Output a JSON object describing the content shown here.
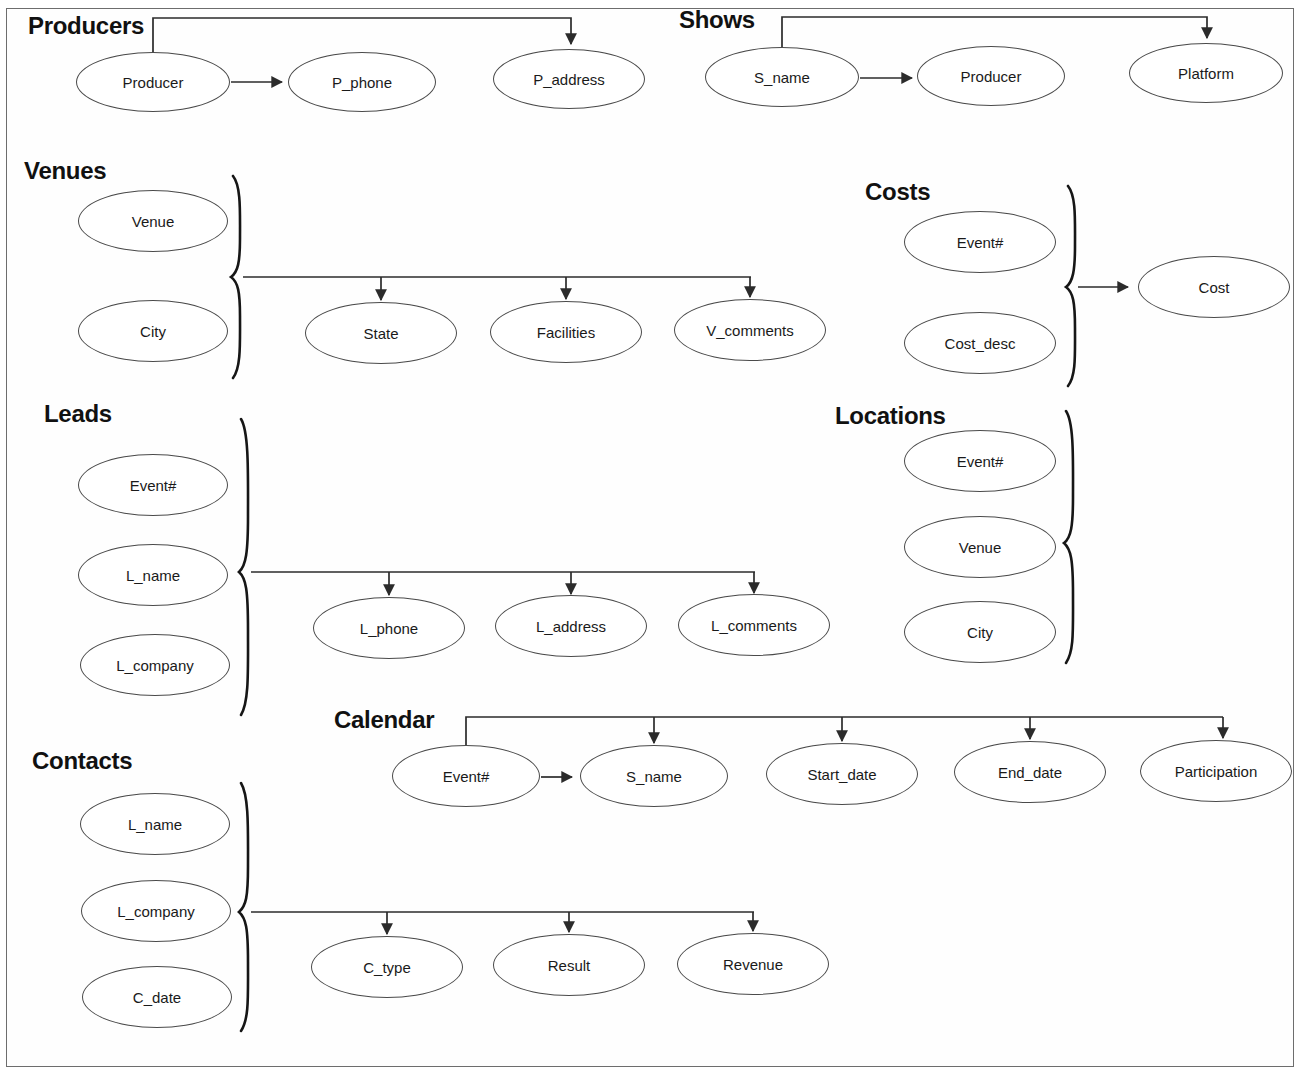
{
  "diagram": {
    "background_color": "#ffffff",
    "border_color": "#6d6d6d",
    "node_stroke_color": "#4a4a4a",
    "edge_color": "#2b2b2b",
    "brace_color": "#161616",
    "groups": [
      {
        "id": "producers",
        "label": "Producers",
        "label_x": 28,
        "label_y": 12,
        "has_brace": false,
        "determinants": [
          "Producer"
        ],
        "dependents": [
          "P_phone",
          "P_address"
        ],
        "nodes": [
          {
            "name": "Producer",
            "cx": 153,
            "cy": 82,
            "rx": 77,
            "ry": 30
          },
          {
            "name": "P_phone",
            "cx": 362,
            "cy": 82,
            "rx": 74,
            "ry": 30
          },
          {
            "name": "P_address",
            "cx": 569,
            "cy": 79,
            "rx": 76,
            "ry": 30
          }
        ]
      },
      {
        "id": "shows",
        "label": "Shows",
        "label_x": 679,
        "label_y": 6,
        "has_brace": false,
        "determinants": [
          "S_name"
        ],
        "dependents": [
          "Producer",
          "Platform"
        ],
        "nodes": [
          {
            "name": "S_name",
            "cx": 782,
            "cy": 77,
            "rx": 77,
            "ry": 30
          },
          {
            "name": "Producer",
            "cx": 991,
            "cy": 76,
            "rx": 74,
            "ry": 30
          },
          {
            "name": "Platform",
            "cx": 1206,
            "cy": 73,
            "rx": 77,
            "ry": 30
          }
        ]
      },
      {
        "id": "venues",
        "label": "Venues",
        "label_x": 24,
        "label_y": 157,
        "has_brace": true,
        "determinants": [
          "Venue",
          "City"
        ],
        "dependents": [
          "State",
          "Facilities",
          "V_comments"
        ],
        "nodes": [
          {
            "name": "Venue",
            "cx": 153,
            "cy": 221,
            "rx": 75,
            "ry": 31
          },
          {
            "name": "City",
            "cx": 153,
            "cy": 331,
            "rx": 75,
            "ry": 31
          },
          {
            "name": "State",
            "cx": 381,
            "cy": 333,
            "rx": 76,
            "ry": 31
          },
          {
            "name": "Facilities",
            "cx": 566,
            "cy": 332,
            "rx": 76,
            "ry": 31
          },
          {
            "name": "V_comments",
            "cx": 750,
            "cy": 330,
            "rx": 76,
            "ry": 31
          }
        ]
      },
      {
        "id": "costs",
        "label": "Costs",
        "label_x": 865,
        "label_y": 178,
        "has_brace": true,
        "determinants": [
          "Event#",
          "Cost_desc"
        ],
        "dependents": [
          "Cost"
        ],
        "nodes": [
          {
            "name": "Event#",
            "cx": 980,
            "cy": 242,
            "rx": 76,
            "ry": 31
          },
          {
            "name": "Cost_desc",
            "cx": 980,
            "cy": 343,
            "rx": 76,
            "ry": 31
          },
          {
            "name": "Cost",
            "cx": 1214,
            "cy": 287,
            "rx": 76,
            "ry": 31
          }
        ]
      },
      {
        "id": "leads",
        "label": "Leads",
        "label_x": 44,
        "label_y": 400,
        "has_brace": true,
        "determinants": [
          "Event#",
          "L_name",
          "L_company"
        ],
        "dependents": [
          "L_phone",
          "L_address",
          "L_comments"
        ],
        "nodes": [
          {
            "name": "Event#",
            "cx": 153,
            "cy": 485,
            "rx": 75,
            "ry": 31
          },
          {
            "name": "L_name",
            "cx": 153,
            "cy": 575,
            "rx": 75,
            "ry": 31
          },
          {
            "name": "L_company",
            "cx": 155,
            "cy": 665,
            "rx": 75,
            "ry": 31
          },
          {
            "name": "L_phone",
            "cx": 389,
            "cy": 628,
            "rx": 76,
            "ry": 31
          },
          {
            "name": "L_address",
            "cx": 571,
            "cy": 626,
            "rx": 76,
            "ry": 31
          },
          {
            "name": "L_comments",
            "cx": 754,
            "cy": 625,
            "rx": 76,
            "ry": 31
          }
        ]
      },
      {
        "id": "locations",
        "label": "Locations",
        "label_x": 835,
        "label_y": 402,
        "has_brace": true,
        "determinants": [
          "Event#",
          "Venue",
          "City"
        ],
        "dependents": [],
        "nodes": [
          {
            "name": "Event#",
            "cx": 980,
            "cy": 461,
            "rx": 76,
            "ry": 31
          },
          {
            "name": "Venue",
            "cx": 980,
            "cy": 547,
            "rx": 76,
            "ry": 31
          },
          {
            "name": "City",
            "cx": 980,
            "cy": 632,
            "rx": 76,
            "ry": 31
          }
        ]
      },
      {
        "id": "calendar",
        "label": "Calendar",
        "label_x": 334,
        "label_y": 706,
        "has_brace": false,
        "determinants": [
          "Event#"
        ],
        "dependents": [
          "S_name",
          "Start_date",
          "End_date",
          "Participation"
        ],
        "nodes": [
          {
            "name": "Event#",
            "cx": 466,
            "cy": 776,
            "rx": 74,
            "ry": 31
          },
          {
            "name": "S_name",
            "cx": 654,
            "cy": 776,
            "rx": 74,
            "ry": 31
          },
          {
            "name": "Start_date",
            "cx": 842,
            "cy": 774,
            "rx": 76,
            "ry": 31
          },
          {
            "name": "End_date",
            "cx": 1030,
            "cy": 772,
            "rx": 76,
            "ry": 31
          },
          {
            "name": "Participation",
            "cx": 1216,
            "cy": 771,
            "rx": 76,
            "ry": 31
          }
        ]
      },
      {
        "id": "contacts",
        "label": "Contacts",
        "label_x": 32,
        "label_y": 747,
        "has_brace": true,
        "determinants": [
          "L_name",
          "L_company",
          "C_date"
        ],
        "dependents": [
          "C_type",
          "Result",
          "Revenue"
        ],
        "nodes": [
          {
            "name": "L_name",
            "cx": 155,
            "cy": 824,
            "rx": 75,
            "ry": 31
          },
          {
            "name": "L_company",
            "cx": 156,
            "cy": 911,
            "rx": 75,
            "ry": 31
          },
          {
            "name": "C_date",
            "cx": 157,
            "cy": 997,
            "rx": 75,
            "ry": 31
          },
          {
            "name": "C_type",
            "cx": 387,
            "cy": 967,
            "rx": 76,
            "ry": 31
          },
          {
            "name": "Result",
            "cx": 569,
            "cy": 965,
            "rx": 76,
            "ry": 31
          },
          {
            "name": "Revenue",
            "cx": 753,
            "cy": 964,
            "rx": 76,
            "ry": 31
          }
        ]
      }
    ]
  }
}
